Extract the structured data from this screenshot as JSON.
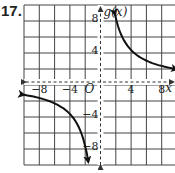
{
  "problem_number": "17.",
  "chart_data": {
    "type": "line",
    "title": "",
    "function_label": "g(x)",
    "xlabel": "x",
    "ylabel": "g(x)",
    "origin_label": "O",
    "xlim": [
      -10,
      10
    ],
    "ylim": [
      -10,
      10
    ],
    "grid": true,
    "grid_step": 2,
    "x_tick_labels": [
      "-8",
      "-4",
      "4",
      "8"
    ],
    "y_tick_labels": [
      "8",
      "4",
      "-4",
      "-8"
    ],
    "asymptotes": {
      "vertical": 0,
      "horizontal": 0
    },
    "series": [
      {
        "name": "g(x) branch 1",
        "x": [
          1.9,
          2,
          3,
          4,
          5,
          6,
          8,
          10
        ],
        "y": [
          8.4,
          8,
          5.33,
          4,
          3.2,
          2.67,
          2,
          1.6
        ]
      },
      {
        "name": "g(x) branch 2",
        "x": [
          -10,
          -8,
          -6,
          -5,
          -4,
          -3,
          -2,
          -1.6
        ],
        "y": [
          -1.6,
          -2,
          -2.67,
          -3.2,
          -4,
          -5.33,
          -8,
          -10
        ]
      }
    ]
  }
}
